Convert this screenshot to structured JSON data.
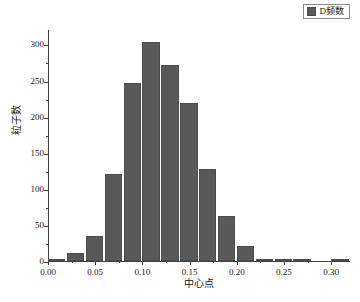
{
  "legend": {
    "position": "top-right",
    "entries": [
      {
        "label": "D频数",
        "color": "#595959",
        "swatch_name": "legend-swatch-d-frequency"
      }
    ]
  },
  "axes": {
    "y": {
      "title": "粒子数",
      "ticks": [
        0,
        50,
        100,
        150,
        200,
        250,
        300
      ],
      "tick_labels": [
        "0",
        "50",
        "100",
        "150",
        "200",
        "250",
        "300"
      ],
      "min": 0,
      "max": 320
    },
    "x": {
      "title": "中心点",
      "ticks": [
        0.0,
        0.05,
        0.1,
        0.15,
        0.2,
        0.25,
        0.3
      ],
      "tick_labels": [
        "0.00",
        "0.05",
        "0.10",
        "0.15",
        "0.20",
        "0.25",
        "0.30"
      ],
      "min": 0.0,
      "max": 0.32
    }
  },
  "chart_data": {
    "type": "bar",
    "title": "",
    "subtitle": "",
    "xlabel": "中心点",
    "ylabel": "粒子数",
    "xlim": [
      0.0,
      0.32
    ],
    "ylim": [
      0,
      320
    ],
    "grid": false,
    "legend_position": "top-right",
    "bar_color": "#595959",
    "bin_width": 0.02,
    "series": [
      {
        "name": "D频数",
        "color": "#595959",
        "x": [
          0.01,
          0.03,
          0.05,
          0.07,
          0.09,
          0.11,
          0.13,
          0.15,
          0.17,
          0.19,
          0.21,
          0.23,
          0.25,
          0.27,
          0.29,
          0.31
        ],
        "values": [
          1,
          11,
          35,
          120,
          246,
          304,
          272,
          219,
          128,
          62,
          21,
          2,
          1,
          2,
          0,
          2
        ]
      }
    ],
    "categories": [
      "0.01",
      "0.03",
      "0.05",
      "0.07",
      "0.09",
      "0.11",
      "0.13",
      "0.15",
      "0.17",
      "0.19",
      "0.21",
      "0.23",
      "0.25",
      "0.27",
      "0.29",
      "0.31"
    ],
    "values": [
      1,
      11,
      35,
      120,
      246,
      304,
      272,
      219,
      128,
      62,
      21,
      2,
      1,
      2,
      0,
      2
    ]
  }
}
